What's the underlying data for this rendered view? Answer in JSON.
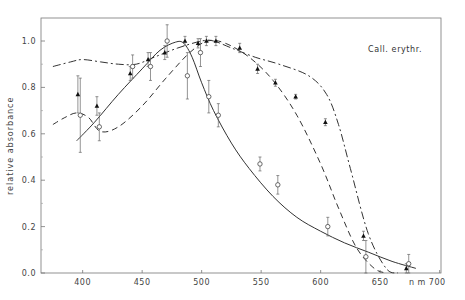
{
  "chart_data": {
    "type": "line",
    "title": "",
    "annotation": "Call. erythr.",
    "xlabel": "n m",
    "ylabel": "relative absorbance",
    "xlim": [
      365,
      700
    ],
    "ylim": [
      0.0,
      1.1
    ],
    "x_ticks": [
      400,
      450,
      500,
      550,
      600,
      650,
      700
    ],
    "x_tick_labels": [
      "400",
      "450",
      "500",
      "550",
      "600",
      "650",
      "n m  700"
    ],
    "y_ticks": [
      0.0,
      0.2,
      0.4,
      0.6,
      0.8,
      1.0
    ],
    "y_tick_labels": [
      "0.0",
      "0.2",
      "0.4",
      "0.6",
      "0.8",
      "1.0"
    ],
    "grid": false,
    "series": [
      {
        "name": "solid curve",
        "style": "solid",
        "x": [
          395,
          410,
          430,
          450,
          465,
          478,
          485,
          492,
          500,
          510,
          525,
          540,
          560,
          580,
          600,
          620,
          640,
          660,
          680
        ],
        "y": [
          0.57,
          0.65,
          0.77,
          0.88,
          0.96,
          0.995,
          0.99,
          0.93,
          0.82,
          0.7,
          0.56,
          0.45,
          0.33,
          0.24,
          0.18,
          0.13,
          0.09,
          0.05,
          0.02
        ]
      },
      {
        "name": "dashed curve",
        "style": "dashed",
        "x": [
          375,
          385,
          395,
          405,
          415,
          430,
          450,
          470,
          490,
          505,
          520,
          540,
          560,
          580,
          600,
          615,
          630,
          645,
          655
        ],
        "y": [
          0.64,
          0.67,
          0.69,
          0.67,
          0.61,
          0.63,
          0.72,
          0.84,
          0.95,
          1.0,
          0.99,
          0.93,
          0.83,
          0.68,
          0.47,
          0.28,
          0.11,
          0.02,
          0.0
        ]
      },
      {
        "name": "dash-dot curve",
        "style": "dash-dot",
        "x": [
          375,
          390,
          400,
          415,
          430,
          445,
          460,
          480,
          500,
          510,
          525,
          545,
          565,
          590,
          605,
          615,
          625,
          640,
          655,
          665
        ],
        "y": [
          0.89,
          0.91,
          0.92,
          0.91,
          0.9,
          0.9,
          0.93,
          0.97,
          1.0,
          1.0,
          0.97,
          0.93,
          0.9,
          0.85,
          0.77,
          0.64,
          0.45,
          0.17,
          0.02,
          0.0
        ]
      },
      {
        "name": "filled triangles",
        "style": "marker-filled",
        "x": [
          397,
          413,
          441,
          456,
          470,
          487,
          498,
          505,
          513,
          533,
          548,
          563,
          580,
          605,
          637,
          673
        ],
        "y": [
          0.77,
          0.72,
          0.86,
          0.92,
          0.95,
          1.0,
          0.99,
          1.0,
          1.0,
          0.97,
          0.88,
          0.82,
          0.76,
          0.65,
          0.16,
          0.02
        ],
        "err": [
          0.08,
          0.04,
          0.03,
          0.03,
          0.03,
          0.02,
          0.02,
          0.02,
          0.02,
          0.02,
          0.02,
          0.015,
          0.01,
          0.015,
          0.02,
          0.02
        ]
      },
      {
        "name": "open circles",
        "style": "marker-open",
        "x": [
          397,
          413,
          441,
          456,
          470,
          487,
          498,
          505,
          513,
          548,
          563,
          605,
          637,
          673
        ],
        "y": [
          0.68,
          0.63,
          0.89,
          0.89,
          1.0,
          0.85,
          0.95,
          0.76,
          0.68,
          0.47,
          0.38,
          0.2,
          0.07,
          0.04
        ],
        "err": [
          0.16,
          0.06,
          0.05,
          0.06,
          0.07,
          0.1,
          0.06,
          0.07,
          0.05,
          0.03,
          0.04,
          0.04,
          0.07,
          0.04
        ]
      }
    ]
  }
}
